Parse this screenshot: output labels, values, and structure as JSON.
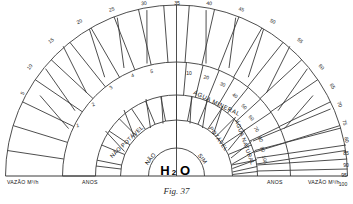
{
  "figure": {
    "caption": "Fig. 37",
    "center_label": {
      "formula_main": "H",
      "formula_sub": "2",
      "formula_tail": "O"
    }
  },
  "axis_labels": {
    "bottom_left_outer": "VAZÃO M³/h",
    "bottom_left_inner": "ANOS",
    "bottom_right_inner": "ANOS",
    "bottom_right_outer": "VAZÃO M³/h"
  },
  "bands": {
    "core_left": "NÃO",
    "core_right": "SIM",
    "ring2_left": "NÃO POTÁVEL",
    "ring2_right": "POTÁVEL",
    "ring3_right_inner": "ÁGUA NATURAL",
    "ring3_right_outer": "ÁGUA MINERAL"
  },
  "chart_data": {
    "type": "pie",
    "title": "Fig. 37",
    "subtitle": "",
    "xlabel": "",
    "ylabel": "",
    "legend_position": "none",
    "grid": false,
    "scales": [
      {
        "name": "ANOS",
        "ring": "inner",
        "side": "left",
        "unit": "anos",
        "tick_labels": [
          "1",
          "2",
          "3",
          "4",
          "5"
        ],
        "values": [
          1,
          2,
          3,
          4,
          5
        ]
      },
      {
        "name": "ANOS",
        "ring": "inner",
        "side": "right",
        "unit": "anos",
        "tick_labels": [
          "10",
          "20",
          "30",
          "40",
          "50",
          "60",
          "70",
          "80",
          "90",
          "100"
        ],
        "values": [
          10,
          20,
          30,
          40,
          50,
          60,
          70,
          80,
          90,
          100
        ]
      },
      {
        "name": "VAZÃO M³/h",
        "ring": "outer",
        "side": "left",
        "unit": "M³/h",
        "tick_labels": [
          "5",
          "10",
          "15",
          "20",
          "25",
          "30",
          "35"
        ],
        "values": [
          5,
          10,
          15,
          20,
          25,
          30,
          35
        ]
      },
      {
        "name": "VAZÃO M³/h",
        "ring": "outer",
        "side": "right",
        "unit": "M³/h",
        "tick_labels": [
          "40",
          "45",
          "50",
          "55",
          "60",
          "65",
          "70",
          "75",
          "80",
          "85",
          "90",
          "95",
          "100"
        ],
        "values": [
          40,
          45,
          50,
          55,
          60,
          65,
          70,
          75,
          80,
          85,
          90,
          95,
          100
        ]
      }
    ],
    "sectors": [
      {
        "label": "NÃO",
        "ring": 1,
        "side": "left"
      },
      {
        "label": "SIM",
        "ring": 1,
        "side": "right"
      },
      {
        "label": "NÃO POTÁVEL",
        "ring": 2,
        "side": "left"
      },
      {
        "label": "POTÁVEL",
        "ring": 2,
        "side": "right"
      },
      {
        "label": "ÁGUA NATURAL",
        "ring": 3,
        "side": "right"
      },
      {
        "label": "ÁGUA MINERAL",
        "ring": 4,
        "side": "right"
      }
    ]
  },
  "outer_ticks_left": [
    "5",
    "10",
    "15",
    "20",
    "25",
    "30"
  ],
  "outer_ticks_top": [
    "35"
  ],
  "outer_ticks_right": [
    "40",
    "45",
    "50",
    "55",
    "60",
    "65",
    "70",
    "75",
    "80",
    "85",
    "90",
    "95",
    "100"
  ],
  "inner_ticks_left": [
    "1",
    "2",
    "3",
    "4",
    "5"
  ],
  "inner_ticks_right": [
    "10",
    "20",
    "30",
    "40",
    "50",
    "60",
    "70",
    "80",
    "90",
    "100"
  ],
  "colors": {
    "stroke": "#3a3a3a",
    "text": "#111111",
    "background": "#ffffff"
  }
}
